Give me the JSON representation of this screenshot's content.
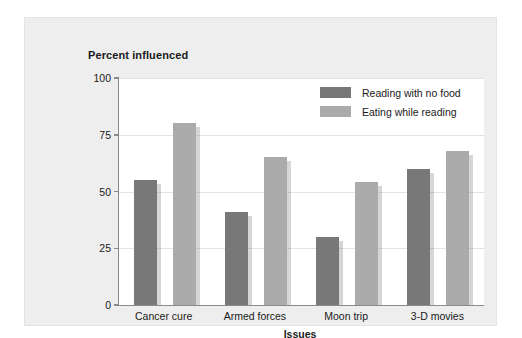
{
  "chart_data": {
    "type": "bar",
    "title": "Percent influenced",
    "xlabel": "Issues",
    "ylabel": "Percent influenced",
    "categories": [
      "Cancer cure",
      "Armed forces",
      "Moon trip",
      "3-D movies"
    ],
    "series": [
      {
        "name": "Reading with no food",
        "color": "#787878",
        "values": [
          55,
          41,
          30,
          60
        ]
      },
      {
        "name": "Eating while reading",
        "color": "#ababab",
        "values": [
          80,
          65,
          54,
          68
        ]
      }
    ],
    "ylim": [
      0,
      100
    ],
    "yticks": [
      0,
      25,
      50,
      75,
      100
    ],
    "ytick_labels": [
      "0",
      "25",
      "50",
      "75",
      "100"
    ],
    "grid": "horizontal",
    "legend_position": "top-right-inside"
  },
  "colors": {
    "panel_background": "#eeeeee",
    "plot_background": "#ffffff",
    "axis": "#8a8a8a",
    "gridline": "#e3e3e3",
    "text": "#1a1a1a",
    "series_dark": "#787878",
    "series_light": "#ababab"
  }
}
